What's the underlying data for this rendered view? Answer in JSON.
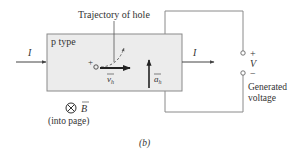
{
  "diagram": {
    "material_label": "p type",
    "trajectory_label": "Trajectory of hole",
    "current_in_label": "I",
    "current_out_label": "I",
    "charge_symbol": "+",
    "velocity_label": "v",
    "velocity_subscript": "h",
    "acceleration_label": "a",
    "acceleration_subscript": "h",
    "field_symbol": "⊗",
    "field_label": "B",
    "field_note": "(into page)",
    "terminal_plus": "+",
    "terminal_minus": "−",
    "voltage_label": "V",
    "generated_line1": "Generated",
    "generated_line2": "voltage",
    "caption": "(b)"
  },
  "colors": {
    "box_fill": "#ececec",
    "box_stroke": "#8a8a8a",
    "wire": "#8a8a8a",
    "arrow": "#222222",
    "text": "#333333"
  }
}
